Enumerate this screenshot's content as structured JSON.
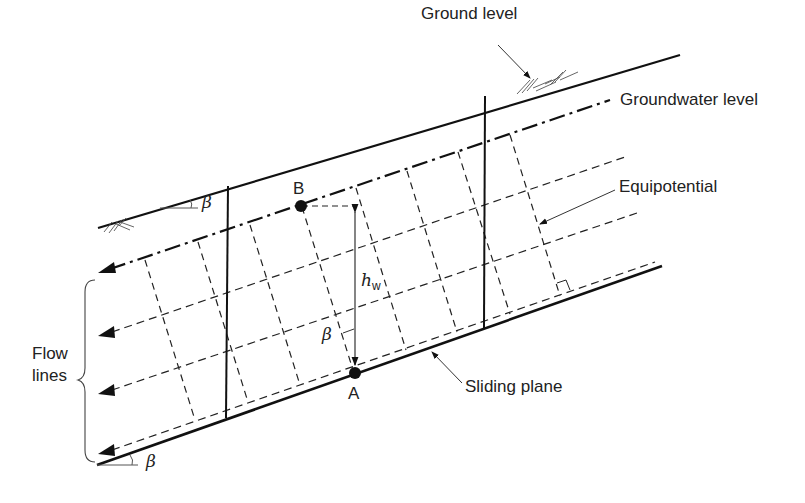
{
  "diagram": {
    "type": "seepage flow net in infinite slope",
    "labels": {
      "ground_level": "Ground level",
      "groundwater_level": "Groundwater level",
      "equipotential": "Equipotential",
      "flow_lines_line1": "Flow",
      "flow_lines_line2": "lines",
      "sliding_plane": "Sliding plane",
      "point_a": "A",
      "point_b": "B",
      "beta_top": "β",
      "beta_mid": "β",
      "beta_bottom": "β",
      "hw_main": "h",
      "hw_sub": "w"
    },
    "colors": {
      "line": "#111111",
      "text": "#222222",
      "background": "#ffffff"
    },
    "elements": [
      "ground surface line (solid)",
      "groundwater level (dash-dot)",
      "3 flow lines (dashed, arrows pointing downslope)",
      "sliding plane (solid)",
      "equipotential lines (dashed, perpendicular to flow)",
      "2 vertical slice boundaries (solid)",
      "point B on groundwater level",
      "point A on sliding plane",
      "pressure head h_w between A and B"
    ]
  }
}
